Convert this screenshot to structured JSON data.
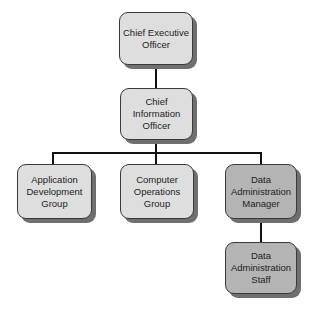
{
  "org_chart": {
    "nodes": [
      {
        "id": "ceo",
        "label": "Chief Executive\nOfficer",
        "shade": "light",
        "parent": null
      },
      {
        "id": "cio",
        "label": "Chief\nInformation\nOfficer",
        "shade": "light",
        "parent": "ceo"
      },
      {
        "id": "adg",
        "label": "Application\nDevelopment\nGroup",
        "shade": "light",
        "parent": "cio"
      },
      {
        "id": "cog",
        "label": "Computer\nOperations\nGroup",
        "shade": "light",
        "parent": "cio"
      },
      {
        "id": "dam",
        "label": "Data\nAdministration\nManager",
        "shade": "dark",
        "parent": "cio"
      },
      {
        "id": "das",
        "label": "Data\nAdministration\nStaff",
        "shade": "dark",
        "parent": "dam"
      }
    ],
    "colors": {
      "light_fill": "#dedede",
      "dark_fill": "#b4b4b4",
      "border": "#3a3a3a",
      "shadow": "#6f6f6f",
      "connector": "#111111"
    }
  }
}
